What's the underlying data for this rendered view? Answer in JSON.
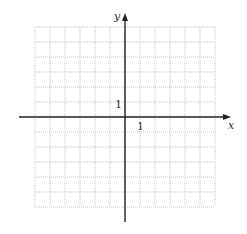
{
  "chart_data": {
    "type": "scatter",
    "title": "",
    "xlabel": "x",
    "ylabel": "y",
    "xlim": [
      -6,
      6
    ],
    "ylim": [
      -6,
      6
    ],
    "grid": true,
    "grid_style": "dotted",
    "series": [],
    "tick_labels": {
      "x": [
        "1"
      ],
      "y": [
        "1"
      ]
    },
    "annotations": []
  },
  "axes": {
    "x_label": "x",
    "y_label": "y",
    "x_unit_label": "1",
    "y_unit_label": "1"
  },
  "colors": {
    "axis": "#222222",
    "grid": "#b5b5b5",
    "background": "#ffffff"
  }
}
